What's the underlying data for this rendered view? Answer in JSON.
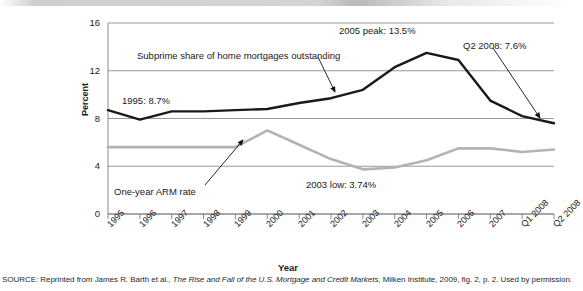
{
  "chart_data": {
    "type": "line",
    "title": "",
    "xlabel": "Year",
    "ylabel": "Percent",
    "ylim": [
      0,
      16
    ],
    "yticks": [
      0,
      4,
      8,
      12,
      16
    ],
    "grid": true,
    "legend_position": "inline-annotations",
    "categories": [
      "1995",
      "1996",
      "1997",
      "1998",
      "1999",
      "2000",
      "2001",
      "2002",
      "2003",
      "2004",
      "2005",
      "2006",
      "2007",
      "Q1 2008",
      "Q2 2008"
    ],
    "series": [
      {
        "name": "Subprime share of home mortgages outstanding",
        "color": "#1a1a1a",
        "values": [
          8.7,
          7.9,
          8.6,
          8.6,
          8.7,
          8.8,
          9.3,
          9.7,
          10.4,
          12.3,
          13.5,
          12.9,
          9.5,
          8.2,
          7.6
        ]
      },
      {
        "name": "One-year ARM rate",
        "color": "#b3b3b3",
        "values": [
          5.6,
          5.6,
          5.6,
          5.6,
          5.6,
          7.0,
          5.8,
          4.6,
          3.74,
          3.9,
          4.5,
          5.5,
          5.5,
          5.2,
          5.4
        ]
      }
    ],
    "annotations": [
      {
        "name": "series-label-subprime",
        "text": "Subprime share of home mortgages outstanding"
      },
      {
        "name": "callout-1995",
        "text": "1995: 8.7%"
      },
      {
        "name": "callout-2005-peak",
        "text": "2005 peak: 13.5%"
      },
      {
        "name": "callout-q2-2008",
        "text": "Q2 2008: 7.6%"
      },
      {
        "name": "series-label-arm",
        "text": "One-year ARM rate"
      },
      {
        "name": "callout-2003-low",
        "text": "2003 low: 3.74%"
      }
    ]
  },
  "axis": {
    "y_title": "Percent",
    "x_title": "Year",
    "y_ticks": [
      "16",
      "12",
      "8",
      "4",
      "0"
    ],
    "x_ticks": [
      "1995",
      "1996",
      "1997",
      "1998",
      "1999",
      "2000",
      "2001",
      "2002",
      "2003",
      "2004",
      "2005",
      "2006",
      "2007",
      "Q1 2008",
      "Q2 2008"
    ]
  },
  "annotations": {
    "subprime_label": "Subprime share of home mortgages outstanding",
    "start_1995": "1995: 8.7%",
    "peak_2005": "2005 peak: 13.5%",
    "q2_2008": "Q2 2008: 7.6%",
    "arm_label": "One-year ARM rate",
    "low_2003": "2003 low: 3.74%"
  },
  "source": {
    "prefix": "SOURCE: Reprinted from James R. Barth et al., ",
    "title": "The Rise and Fall of the U.S. Mortgage and Credit Markets",
    "suffix": ", Milken Institute, 2009, fig. 2, p. 2. Used by permission."
  }
}
